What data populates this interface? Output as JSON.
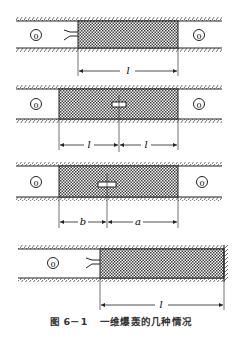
{
  "figure": {
    "caption_number": "图 6－1",
    "caption_title": "一维爆轰的几种情况"
  },
  "panels": [
    {
      "id": "panel-1",
      "description": "Detonation initiated at left end of explosive column in open tube",
      "region_left_label": "0",
      "region_right_label": "0",
      "initiation": "left-end",
      "dimensions": [
        {
          "label": "l"
        }
      ]
    },
    {
      "id": "panel-2",
      "description": "Detonation initiated at center of explosive column",
      "region_left_label": "0",
      "region_right_label": "0",
      "initiation": "center",
      "dimensions": [
        {
          "label": "l"
        },
        {
          "label": "l"
        }
      ]
    },
    {
      "id": "panel-3",
      "description": "Detonation initiated at off-center point",
      "region_left_label": "0",
      "region_right_label": "0",
      "initiation": "off-center",
      "dimensions": [
        {
          "label": "b"
        },
        {
          "label": "a"
        }
      ]
    },
    {
      "id": "panel-4",
      "description": "Detonation initiated at left end, right end against rigid wall",
      "region_left_label": "0",
      "initiation": "left-end",
      "right_boundary": "rigid-wall",
      "dimensions": [
        {
          "label": "l"
        }
      ]
    }
  ],
  "colors": {
    "line": "#222222",
    "hatch": "#555555",
    "background": "#ffffff"
  }
}
